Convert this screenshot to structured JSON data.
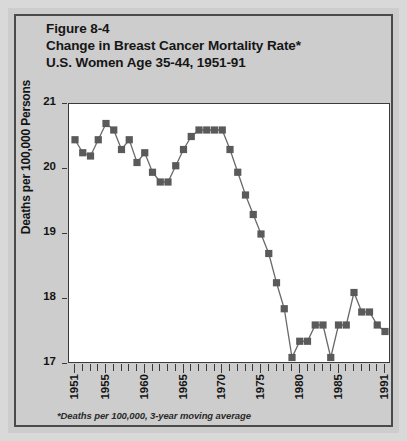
{
  "figure": {
    "label": "Figure 8-4",
    "title_line1": "Change in Breast Cancer Mortality Rate*",
    "title_line2": "U.S. Women Age 35-44, 1951-91",
    "footnote": "*Deaths per 100,000, 3-year moving average"
  },
  "colors": {
    "page_background": "#d9d9d9",
    "paper": "#cdcdcd",
    "plot_background": "#ffffff",
    "frame": "#3a3a3a",
    "marker": "#5a5a5a",
    "line": "#6a6a6a",
    "text": "#141414"
  },
  "chart_data": {
    "type": "line",
    "title": "Change in Breast Cancer Mortality Rate* U.S. Women Age 35-44, 1951-91",
    "subtitle": "Figure 8-4",
    "xlabel": "",
    "ylabel": "Deaths per 100,000 Persons",
    "xlim": [
      1951,
      1991
    ],
    "ylim": [
      17,
      21
    ],
    "grid": false,
    "legend": null,
    "marker": "square",
    "y_ticks": [
      17,
      18,
      19,
      20,
      21
    ],
    "y_tick_labels": [
      "17",
      "18",
      "19",
      "20",
      "21"
    ],
    "x_ticks": [
      1951,
      1952,
      1953,
      1954,
      1955,
      1956,
      1957,
      1958,
      1959,
      1960,
      1961,
      1962,
      1963,
      1964,
      1965,
      1966,
      1967,
      1968,
      1969,
      1970,
      1971,
      1972,
      1973,
      1974,
      1975,
      1976,
      1977,
      1978,
      1979,
      1980,
      1981,
      1982,
      1983,
      1984,
      1985,
      1986,
      1987,
      1988,
      1989,
      1990,
      1991
    ],
    "x_tick_labels_major": [
      "1951",
      "1955",
      "1960",
      "1965",
      "1970",
      "1975",
      "1980",
      "1985",
      "1991"
    ],
    "x_major_ticks": [
      1951,
      1955,
      1960,
      1965,
      1970,
      1975,
      1980,
      1985,
      1991
    ],
    "x": [
      1951,
      1952,
      1953,
      1954,
      1955,
      1956,
      1957,
      1958,
      1959,
      1960,
      1961,
      1962,
      1963,
      1964,
      1965,
      1966,
      1967,
      1968,
      1969,
      1970,
      1971,
      1972,
      1973,
      1974,
      1975,
      1976,
      1977,
      1978,
      1979,
      1980,
      1981,
      1982,
      1983,
      1984,
      1985,
      1986,
      1987,
      1988,
      1989,
      1990,
      1991
    ],
    "values": [
      20.45,
      20.25,
      20.2,
      20.45,
      20.7,
      20.6,
      20.3,
      20.45,
      20.1,
      20.25,
      19.95,
      19.8,
      19.8,
      20.05,
      20.3,
      20.5,
      20.6,
      20.6,
      20.6,
      20.6,
      20.3,
      19.95,
      19.6,
      19.3,
      19.0,
      18.7,
      18.25,
      17.85,
      17.1,
      17.35,
      17.35,
      17.6,
      17.6,
      17.1,
      17.6,
      17.6,
      18.1,
      17.8,
      17.8,
      17.6,
      17.5
    ],
    "series": [
      {
        "name": "Breast cancer mortality rate, U.S. women age 35-44",
        "values": [
          20.45,
          20.25,
          20.2,
          20.45,
          20.7,
          20.6,
          20.3,
          20.45,
          20.1,
          20.25,
          19.95,
          19.8,
          19.8,
          20.05,
          20.3,
          20.5,
          20.6,
          20.6,
          20.6,
          20.6,
          20.3,
          19.95,
          19.6,
          19.3,
          19.0,
          18.7,
          18.25,
          17.85,
          17.1,
          17.35,
          17.35,
          17.6,
          17.6,
          17.1,
          17.6,
          17.6,
          18.1,
          17.8,
          17.8,
          17.6,
          17.5
        ]
      }
    ],
    "units": "Deaths per 100,000 Persons"
  }
}
